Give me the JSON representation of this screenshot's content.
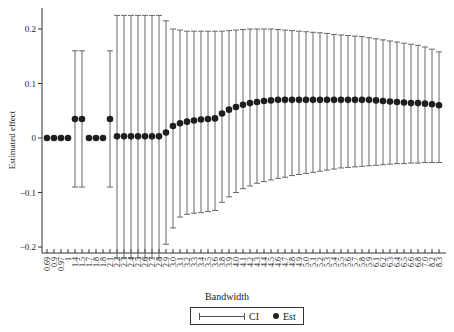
{
  "chart_data": {
    "type": "scatter",
    "title": "",
    "xlabel": "Bandwidth",
    "ylabel": "Estimated effect",
    "ylim": [
      -0.23,
      0.24
    ],
    "yticks": [
      0.2,
      0.1,
      0,
      -0.1,
      -0.2
    ],
    "ytick_labels": [
      "0.2",
      "0.1",
      "0",
      "−0.1",
      "−0.2"
    ],
    "grid": false,
    "legend": {
      "position": "bottom",
      "entries": [
        "CI",
        "Est"
      ]
    },
    "categories": [
      "0.69",
      "0.9",
      "0.97",
      "1",
      "1.4",
      "1.5",
      "1.7",
      "1.8",
      "1.8",
      "2.1",
      "2.2",
      "2.3",
      "2.4",
      "2.5",
      "2.6",
      "2.7",
      "2.8",
      "2.9",
      "3.0",
      "3.1",
      "3.2",
      "3.3",
      "3.4",
      "3.5",
      "3.6",
      "3.8",
      "3.9",
      "4.0",
      "4.1",
      "4.2",
      "4.3",
      "4.4",
      "4.5",
      "4.6",
      "4.7",
      "4.8",
      "4.9",
      "5.0",
      "5.1",
      "5.2",
      "5.3",
      "5.4",
      "5.5",
      "5.6",
      "5.7",
      "5.8",
      "5.9",
      "6.1",
      "6.2",
      "6.3",
      "6.4",
      "6.5",
      "6.6",
      "6.8",
      "7.0",
      "8.2",
      "8.3"
    ],
    "series": [
      {
        "name": "Est",
        "values": [
          0,
          0,
          0,
          0,
          0.035,
          0.035,
          0,
          0,
          0,
          0.035,
          0.003,
          0.003,
          0.003,
          0.003,
          0.003,
          0.003,
          0.003,
          0.01,
          0.022,
          0.027,
          0.03,
          0.032,
          0.034,
          0.035,
          0.036,
          0.045,
          0.052,
          0.057,
          0.061,
          0.064,
          0.066,
          0.068,
          0.069,
          0.07,
          0.07,
          0.07,
          0.07,
          0.07,
          0.07,
          0.07,
          0.07,
          0.07,
          0.07,
          0.07,
          0.07,
          0.07,
          0.07,
          0.069,
          0.068,
          0.067,
          0.066,
          0.065,
          0.064,
          0.064,
          0.063,
          0.062,
          0.06
        ]
      },
      {
        "name": "CI_upper",
        "values": [
          null,
          null,
          null,
          null,
          0.16,
          0.16,
          null,
          null,
          null,
          0.16,
          0.225,
          0.225,
          0.225,
          0.225,
          0.225,
          0.225,
          0.225,
          0.215,
          0.2,
          0.198,
          0.196,
          0.196,
          0.196,
          0.196,
          0.196,
          0.196,
          0.197,
          0.198,
          0.199,
          0.2,
          0.2,
          0.2,
          0.2,
          0.199,
          0.198,
          0.197,
          0.196,
          0.195,
          0.194,
          0.193,
          0.192,
          0.19,
          0.189,
          0.188,
          0.187,
          0.186,
          0.184,
          0.182,
          0.18,
          0.178,
          0.176,
          0.174,
          0.172,
          0.17,
          0.167,
          0.163,
          0.158
        ]
      },
      {
        "name": "CI_lower",
        "values": [
          null,
          null,
          null,
          null,
          -0.09,
          -0.09,
          null,
          null,
          null,
          -0.09,
          -0.22,
          -0.22,
          -0.22,
          -0.22,
          -0.22,
          -0.22,
          -0.22,
          -0.195,
          -0.165,
          -0.145,
          -0.14,
          -0.138,
          -0.137,
          -0.135,
          -0.133,
          -0.118,
          -0.108,
          -0.1,
          -0.093,
          -0.088,
          -0.083,
          -0.08,
          -0.077,
          -0.074,
          -0.072,
          -0.069,
          -0.067,
          -0.065,
          -0.063,
          -0.061,
          -0.059,
          -0.057,
          -0.055,
          -0.054,
          -0.053,
          -0.052,
          -0.051,
          -0.05,
          -0.049,
          -0.048,
          -0.047,
          -0.047,
          -0.046,
          -0.046,
          -0.045,
          -0.045,
          -0.045
        ]
      }
    ]
  },
  "legend": {
    "ci_label": "CI",
    "est_label": "Est"
  },
  "axes": {
    "xlabel": "Bandwidth",
    "ylabel": "Estimated effect"
  }
}
